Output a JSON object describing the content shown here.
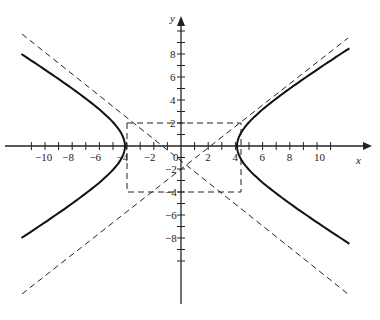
{
  "chart_data": {
    "type": "line",
    "title": "",
    "xlabel": "x",
    "ylabel": "y",
    "x_ticks": [
      "-10",
      "-8",
      "-6",
      "-4",
      "-2",
      "0",
      "2",
      "4",
      "6",
      "8",
      "10"
    ],
    "y_ticks": [
      "8",
      "6",
      "4",
      "2",
      "-2",
      "-4",
      "-6",
      "-8"
    ],
    "xlim": [
      -12,
      12
    ],
    "ylim": [
      -10,
      10
    ],
    "grid": false,
    "series": [
      {
        "name": "hyperbola",
        "equation": "x^2/16 - y^2/9 = 1",
        "style": "solid"
      },
      {
        "name": "asymptote y=3x/4",
        "style": "dashed"
      },
      {
        "name": "asymptote y=-3x/4",
        "style": "dashed"
      },
      {
        "name": "central rectangle x=±4, y=±3",
        "style": "dashed"
      }
    ]
  }
}
